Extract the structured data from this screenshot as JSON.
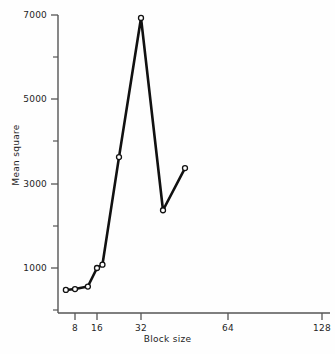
{
  "figure": {
    "background": "#fefefe",
    "ink_color": "#111111",
    "axis_color": "#555555"
  },
  "chart_data": {
    "type": "line",
    "title": "",
    "xlabel": "Block size",
    "ylabel": "Mean square",
    "x_scale": "log2",
    "x_tick_labels": [
      "8",
      "16",
      "32",
      "64",
      "128"
    ],
    "x_tick_values": [
      8,
      16,
      32,
      64,
      128
    ],
    "y_tick_labels": [
      "1000",
      "3000",
      "5000",
      "7000"
    ],
    "y_tick_values": [
      1000,
      3000,
      5000,
      7000
    ],
    "y_minor_ticks": [
      2000,
      4000,
      6000
    ],
    "xlim": [
      2.8,
      128
    ],
    "ylim": [
      430,
      7120
    ],
    "grid": false,
    "legend": null,
    "marker": "open-circle",
    "x": [
      3,
      4,
      6,
      8,
      9.5,
      16,
      32,
      64,
      128
    ],
    "values": [
      480,
      500,
      560,
      1000,
      1080,
      3630,
      6930,
      2370,
      3370
    ],
    "points": [
      {
        "x": 3,
        "y": 480
      },
      {
        "x": 4,
        "y": 500
      },
      {
        "x": 6,
        "y": 560
      },
      {
        "x": 8,
        "y": 1000
      },
      {
        "x": 9.5,
        "y": 1080
      },
      {
        "x": 16,
        "y": 3630
      },
      {
        "x": 32,
        "y": 6930
      },
      {
        "x": 64,
        "y": 2370
      },
      {
        "x": 128,
        "y": 3370
      }
    ]
  }
}
